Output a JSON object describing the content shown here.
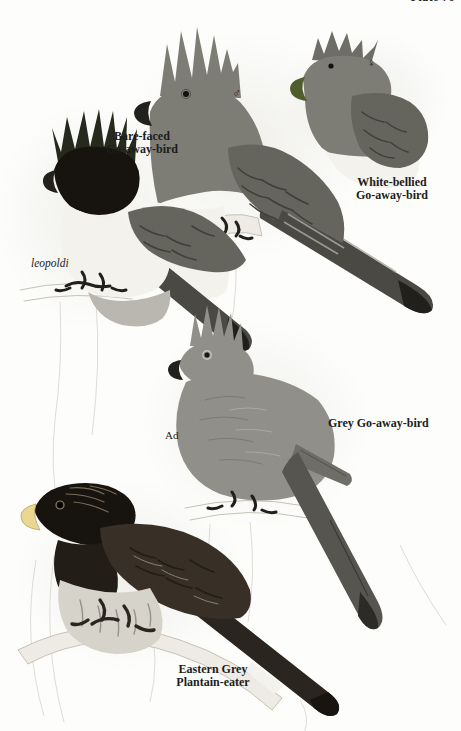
{
  "plate": {
    "header": "Plate 76"
  },
  "figures": {
    "bare_faced": {
      "name_line1": "Bare-faced",
      "name_line2": "Go-away-bird",
      "subspecies_label": "leopoldi"
    },
    "white_bellied": {
      "name_line1": "White-bellied",
      "name_line2": "Go-away-bird",
      "male_symbol": "♂",
      "female_symbol": "♀"
    },
    "grey": {
      "name": "Grey Go-away-bird",
      "age_label": "Ad"
    },
    "eastern_grey": {
      "name_line1": "Eastern Grey",
      "name_line2": "Plantain-eater",
      "female_symbol": "♀"
    }
  },
  "colors": {
    "paper": "#fdfdfb",
    "text": "#1c1c1c",
    "olive_crest": "#262a1d",
    "face_black": "#17130f",
    "bill_black": "#23211d",
    "white_plumage": "#f4f2ec",
    "pale_grey": "#b9b7b0",
    "mid_grey": "#7d7c75",
    "wing_grey": "#65645d",
    "scallop_dark": "#403f39",
    "dark_grey": "#4a4943",
    "near_black": "#22201c",
    "grey_goaway": "#908f89",
    "grey_goaway_dark": "#6e6d66",
    "bill_olive": "#505e2e",
    "brown_dark": "#382f26",
    "brown_darker": "#221d17",
    "crest_gloss": "#796c55",
    "bill_yellow": "#ead792",
    "underparts": "#d6d3ca",
    "streak_grey": "#94918a",
    "branch_pale": "#edebe4",
    "branch_line": "#c6c2b7"
  }
}
